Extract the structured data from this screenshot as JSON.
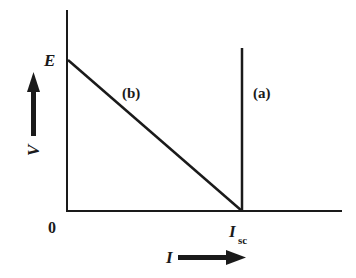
{
  "diagram": {
    "title": "",
    "axes": {
      "y_label": "V",
      "x_label": "I",
      "origin_label": "0"
    },
    "points": {
      "E": "E",
      "Isc_main": "I",
      "Isc_sub": "sc"
    },
    "curves": [
      {
        "id": "a",
        "label": "(a)",
        "description": "vertical line at I = Isc"
      },
      {
        "id": "b",
        "label": "(b)",
        "description": "straight line from (0, E) to (Isc, 0)"
      }
    ],
    "colors": {
      "ink": "#1a1a1a",
      "background": "#ffffff"
    }
  }
}
